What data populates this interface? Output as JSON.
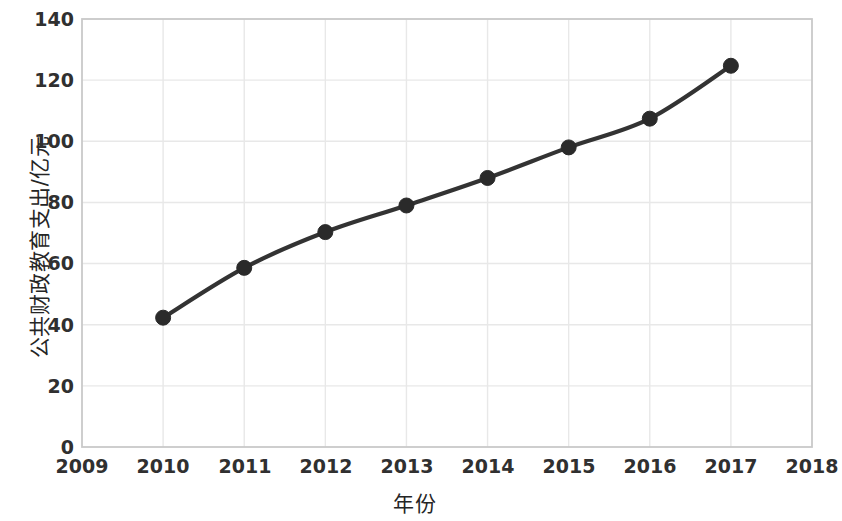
{
  "chart_data": {
    "type": "line",
    "title": "",
    "xlabel": "年份",
    "ylabel": "公共财政教育支出/亿元",
    "x": [
      2010,
      2011,
      2012,
      2013,
      2014,
      2015,
      2016,
      2017
    ],
    "values": [
      42.3,
      58.6,
      70.3,
      79.0,
      88.0,
      98.0,
      107.4,
      124.7
    ],
    "series": [
      {
        "name": "公共财政教育支出",
        "values": [
          42.3,
          58.6,
          70.3,
          79.0,
          88.0,
          98.0,
          107.4,
          124.7
        ]
      }
    ],
    "xticklabels": [
      "2009",
      "2010",
      "2011",
      "2012",
      "2013",
      "2014",
      "2015",
      "2016",
      "2017",
      "2018"
    ],
    "xticks": [
      2009,
      2010,
      2011,
      2012,
      2013,
      2014,
      2015,
      2016,
      2017,
      2018
    ],
    "yticklabels": [
      "0",
      "20",
      "40",
      "60",
      "80",
      "100",
      "120",
      "140"
    ],
    "yticks": [
      0,
      20,
      40,
      60,
      80,
      100,
      120,
      140
    ],
    "xlim": [
      2009,
      2018
    ],
    "ylim": [
      0,
      140
    ],
    "grid": true,
    "legend": "none",
    "line_color": "#333333",
    "marker_color": "#2a2a2a",
    "grid_color": "#e8e8e8",
    "axis_color": "#c9c9c9"
  }
}
